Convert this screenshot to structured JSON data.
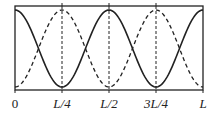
{
  "diagram": {
    "x_labels": [
      {
        "text": "0",
        "pos": 0
      },
      {
        "text": "L/4",
        "pos": 0.25
      },
      {
        "text": "L/2",
        "pos": 0.5
      },
      {
        "text": "3L/4",
        "pos": 0.75
      },
      {
        "text": "L",
        "pos": 1.0
      }
    ],
    "curves": [
      {
        "name": "solid",
        "style": "solid",
        "function": "cos(4*pi*x/L)"
      },
      {
        "name": "dashed",
        "style": "dashed",
        "function": "-cos(4*pi*x/L)"
      }
    ],
    "colors": {
      "line": "#222222",
      "background": "#ffffff"
    }
  }
}
